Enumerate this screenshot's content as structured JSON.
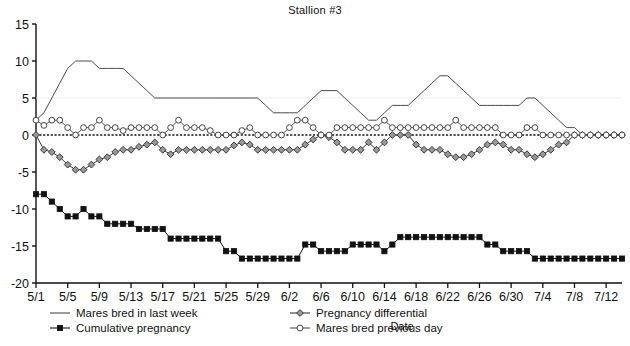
{
  "chart_data": {
    "type": "line",
    "title": "Stallion #3",
    "xlabel": "Date",
    "ylabel": "",
    "ylim": [
      -20,
      15
    ],
    "yticks": [
      15,
      10,
      5,
      0,
      -5,
      -10,
      -15,
      -20
    ],
    "grid": false,
    "legend_position": "bottom",
    "x": [
      "5/1",
      "5/2",
      "5/3",
      "5/4",
      "5/5",
      "5/6",
      "5/7",
      "5/8",
      "5/9",
      "5/10",
      "5/11",
      "5/12",
      "5/13",
      "5/14",
      "5/15",
      "5/16",
      "5/17",
      "5/18",
      "5/19",
      "5/20",
      "5/21",
      "5/22",
      "5/23",
      "5/24",
      "5/25",
      "5/26",
      "5/27",
      "5/28",
      "5/29",
      "5/30",
      "5/31",
      "6/1",
      "6/2",
      "6/3",
      "6/4",
      "6/5",
      "6/6",
      "6/7",
      "6/8",
      "6/9",
      "6/10",
      "6/11",
      "6/12",
      "6/13",
      "6/14",
      "6/15",
      "6/16",
      "6/17",
      "6/18",
      "6/19",
      "6/20",
      "6/21",
      "6/22",
      "6/23",
      "6/24",
      "6/25",
      "6/26",
      "6/27",
      "6/28",
      "6/29",
      "6/30",
      "7/1",
      "7/2",
      "7/3",
      "7/4",
      "7/5",
      "7/6",
      "7/7",
      "7/8",
      "7/9",
      "7/10",
      "7/11",
      "7/12",
      "7/13",
      "7/14"
    ],
    "xtick_labels": [
      "5/1",
      "5/5",
      "5/9",
      "5/13",
      "5/17",
      "5/21",
      "5/25",
      "5/29",
      "6/2",
      "6/6",
      "6/10",
      "6/14",
      "6/18",
      "6/22",
      "6/26",
      "6/30",
      "7/4",
      "7/8",
      "7/12"
    ],
    "xtick_indices": [
      0,
      4,
      8,
      12,
      16,
      20,
      24,
      28,
      32,
      36,
      40,
      44,
      48,
      52,
      56,
      60,
      64,
      68,
      72
    ],
    "series": [
      {
        "name": "Mares bred in last week",
        "marker": "none",
        "line_color": "#4a4a4a",
        "values": [
          2,
          3,
          5,
          7,
          9,
          10,
          10,
          10,
          9,
          9,
          9,
          9,
          8,
          7,
          6,
          5,
          5,
          5,
          5,
          5,
          5,
          5,
          5,
          5,
          5,
          5,
          5,
          5,
          5,
          4,
          3,
          3,
          3,
          3,
          4,
          5,
          6,
          6,
          6,
          5,
          4,
          3,
          2,
          2,
          3,
          4,
          4,
          4,
          5,
          6,
          7,
          8,
          8,
          7,
          6,
          5,
          4,
          4,
          4,
          4,
          4,
          4,
          5,
          5,
          4,
          3,
          2,
          1,
          1,
          0,
          0,
          0,
          0,
          0,
          0
        ]
      },
      {
        "name": "Cumulative pregnancy",
        "marker": "filled-square",
        "line_color": "#111111",
        "marker_color": "#111111",
        "values": [
          -8,
          -8,
          -9,
          -10,
          -11,
          -11,
          -10,
          -11,
          -11,
          -12,
          -12,
          -12,
          -12,
          -12.7,
          -12.7,
          -12.7,
          -12.7,
          -14,
          -14,
          -14,
          -14,
          -14,
          -14,
          -14,
          -15.7,
          -15.7,
          -16.7,
          -16.7,
          -16.7,
          -16.7,
          -16.7,
          -16.7,
          -16.7,
          -16.7,
          -14.8,
          -14.8,
          -15.7,
          -15.7,
          -15.7,
          -15.7,
          -14.8,
          -14.8,
          -14.8,
          -14.8,
          -15.7,
          -14.8,
          -13.8,
          -13.8,
          -13.8,
          -13.8,
          -13.8,
          -13.8,
          -13.8,
          -13.8,
          -13.8,
          -13.8,
          -13.8,
          -14.8,
          -14.8,
          -15.7,
          -15.7,
          -15.7,
          -15.7,
          -16.7,
          -16.7,
          -16.7,
          -16.7,
          -16.7,
          -16.7,
          -16.7,
          -16.7,
          -16.7,
          -16.7,
          -16.7,
          -16.7
        ]
      },
      {
        "name": "Pregnancy differential",
        "marker": "filled-diamond",
        "line_color": "#3a3a3a",
        "marker_color": "#999999",
        "values": [
          0,
          -2,
          -2.3,
          -3,
          -4,
          -4.7,
          -4.7,
          -4,
          -3.3,
          -3,
          -2.3,
          -2,
          -2,
          -1.6,
          -1.3,
          -1,
          -2,
          -2.6,
          -2,
          -2,
          -2,
          -2,
          -2,
          -2,
          -2,
          -1.4,
          -1,
          -1.3,
          -2,
          -2,
          -2,
          -2,
          -2,
          -2,
          -1.3,
          -0.6,
          0,
          -0.3,
          -1,
          -2,
          -2,
          -2,
          -1,
          -2,
          -1,
          0,
          0,
          0,
          -1.3,
          -2,
          -2,
          -2,
          -2.6,
          -3,
          -3,
          -2.6,
          -2,
          -1.3,
          -1,
          -1.3,
          -2,
          -2,
          -2.6,
          -3,
          -2.6,
          -2,
          -1.3,
          -1,
          0,
          0,
          0,
          0,
          0,
          0,
          0
        ]
      },
      {
        "name": "Mares bred previous day",
        "marker": "open-circle",
        "line_color": "#555555",
        "marker_color": "#ffffff",
        "values": [
          2,
          1.3,
          2,
          2,
          1,
          0,
          1,
          1,
          2,
          1,
          1,
          0.6,
          1,
          1,
          1,
          1,
          0,
          1,
          2,
          1,
          1,
          1,
          0.6,
          0,
          0,
          0,
          0.6,
          1,
          0,
          0,
          0,
          0,
          1,
          2,
          2,
          1,
          0,
          0,
          1,
          1,
          1,
          1,
          1,
          1,
          2,
          1,
          1,
          1,
          1,
          1,
          1,
          1,
          1,
          2,
          1,
          1,
          1,
          1,
          1,
          0,
          0,
          0,
          1,
          1,
          0,
          0,
          0,
          0,
          0,
          0,
          0,
          0,
          0,
          0,
          0
        ]
      }
    ],
    "zero_line": true
  },
  "legend": {
    "items": [
      {
        "label": "Mares bred in last week",
        "marker": "none"
      },
      {
        "label": "Cumulative pregnancy",
        "marker": "filled-square"
      },
      {
        "label": "Pregnancy differential",
        "marker": "filled-diamond"
      },
      {
        "label": "Mares bred previous day",
        "marker": "open-circle"
      }
    ]
  },
  "colors": {
    "axis": "#111111",
    "plain_line": "#4a4a4a",
    "square_series": "#111111",
    "diamond_fill": "#999999",
    "circle_fill": "#ffffff",
    "zero_line": "#111111"
  }
}
